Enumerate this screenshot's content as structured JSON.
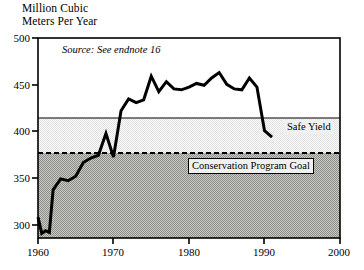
{
  "chart_data": {
    "type": "line",
    "title": "",
    "ylabel": "Million Cubic\nMeters Per Year",
    "xlabel": "",
    "xlim": [
      1960,
      2000
    ],
    "ylim": [
      280,
      500
    ],
    "yticks": [
      300,
      350,
      400,
      450,
      500
    ],
    "ytick_labels": [
      "300",
      "350",
      "400",
      "450",
      "500"
    ],
    "xticks": [
      1960,
      1970,
      1980,
      1990,
      2000
    ],
    "xtick_labels": [
      "1960",
      "1970",
      "1980",
      "1990",
      "2000"
    ],
    "grid": false,
    "legend": "none",
    "annotations": [
      {
        "name": "source",
        "text": "Source: See endnote 16",
        "x": 1964,
        "y": 487
      },
      {
        "name": "safe-yield",
        "text": "Safe Yield",
        "x": 1992,
        "y": 408
      },
      {
        "name": "conservation-goal",
        "text": "Conservation Program Goal",
        "x": 1982,
        "y": 365
      }
    ],
    "reference_lines": [
      {
        "name": "Safe Yield",
        "value": 415,
        "style": "solid"
      },
      {
        "name": "Conservation Program Goal",
        "value": 372,
        "style": "dashed"
      }
    ],
    "shaded_bands": [
      {
        "name": "above-safe-yield",
        "from": 415,
        "to": 500,
        "fill": "#ffffff"
      },
      {
        "name": "safe-yield-to-goal",
        "from": 372,
        "to": 415,
        "fill": "#e8e8e6"
      },
      {
        "name": "below-goal",
        "from": 280,
        "to": 372,
        "fill": "#a3a3a0"
      }
    ],
    "series": [
      {
        "name": "Groundwater Withdrawal",
        "x": [
          1960,
          1960.5,
          1961,
          1961.5,
          1962,
          1963,
          1964,
          1965,
          1966,
          1967,
          1968,
          1969,
          1970,
          1971,
          1972,
          1973,
          1974,
          1975,
          1976,
          1977,
          1978,
          1979,
          1980,
          1981,
          1982,
          1983,
          1984,
          1985,
          1986,
          1987,
          1988,
          1989,
          1990,
          1991
        ],
        "values": [
          303,
          285,
          288,
          286,
          333,
          345,
          343,
          348,
          363,
          368,
          371,
          395,
          369,
          420,
          433,
          429,
          432,
          458,
          441,
          452,
          444,
          443,
          446,
          450,
          448,
          456,
          462,
          449,
          444,
          443,
          456,
          446,
          398,
          391
        ]
      }
    ]
  }
}
